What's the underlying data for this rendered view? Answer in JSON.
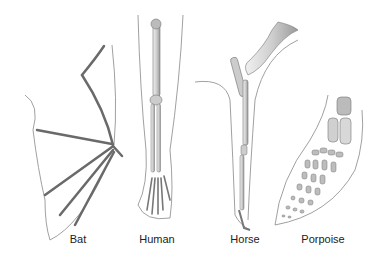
{
  "diagram": {
    "labels": [
      {
        "id": "bat",
        "text": "Bat",
        "x": 78
      },
      {
        "id": "human",
        "text": "Human",
        "x": 157
      },
      {
        "id": "horse",
        "text": "Horse",
        "x": 245
      },
      {
        "id": "porpoise",
        "text": "Porpoise",
        "x": 323
      }
    ],
    "colors": {
      "bone": "#d6d6d6",
      "bone_stroke": "#6a6a6a",
      "outline": "#8a8a8a",
      "label": "#222222"
    }
  }
}
